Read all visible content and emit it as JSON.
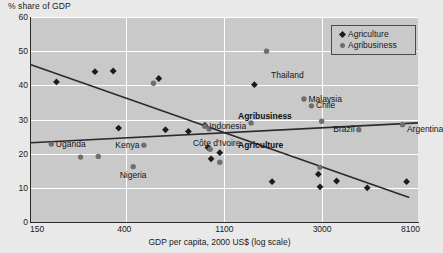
{
  "chart_data": {
    "type": "scatter",
    "title": "",
    "ylabel": "% share of GDP",
    "xlabel": "GDP per capita, 2000 US$ (log scale)",
    "xscale": "log",
    "xlim": [
      150,
      8100
    ],
    "ylim": [
      0,
      60
    ],
    "yticks": [
      0,
      10,
      20,
      30,
      40,
      50,
      60
    ],
    "xticks": [
      150,
      400,
      1100,
      3000,
      8100
    ],
    "xtick_labels": [
      "150",
      "400",
      "1100",
      "3000",
      "8100"
    ],
    "ytick_labels": [
      "0",
      "10",
      "20",
      "30",
      "40",
      "50",
      "60"
    ],
    "grid": true,
    "legend_position": "top-right",
    "legend": [
      {
        "name": "Agriculture",
        "marker": "diamond",
        "color": "#1b1b1b"
      },
      {
        "name": "Agribusiness",
        "marker": "circle",
        "color": "#6e6e6e"
      }
    ],
    "series": [
      {
        "name": "Agriculture",
        "marker": "diamond",
        "color": "#1b1b1b",
        "points": [
          {
            "x": 195,
            "y": 41.0
          },
          {
            "x": 290,
            "y": 44.0
          },
          {
            "x": 350,
            "y": 44.2
          },
          {
            "x": 370,
            "y": 27.5
          },
          {
            "x": 560,
            "y": 42.0
          },
          {
            "x": 600,
            "y": 27.0
          },
          {
            "x": 760,
            "y": 26.5
          },
          {
            "x": 900,
            "y": 28.3
          },
          {
            "x": 930,
            "y": 21.8
          },
          {
            "x": 960,
            "y": 18.5
          },
          {
            "x": 1050,
            "y": 20.3
          },
          {
            "x": 1500,
            "y": 40.2
          },
          {
            "x": 1800,
            "y": 11.8
          },
          {
            "x": 2900,
            "y": 14.0
          },
          {
            "x": 2950,
            "y": 10.3
          },
          {
            "x": 3500,
            "y": 12.0
          },
          {
            "x": 4800,
            "y": 10.0
          },
          {
            "x": 7200,
            "y": 11.8
          }
        ]
      },
      {
        "name": "Agribusiness",
        "marker": "circle",
        "color": "#6e6e6e",
        "points": [
          {
            "x": 185,
            "y": 22.8
          },
          {
            "x": 250,
            "y": 19.0
          },
          {
            "x": 300,
            "y": 19.2
          },
          {
            "x": 430,
            "y": 16.2
          },
          {
            "x": 480,
            "y": 22.5
          },
          {
            "x": 530,
            "y": 40.6
          },
          {
            "x": 900,
            "y": 28.0
          },
          {
            "x": 940,
            "y": 27.2
          },
          {
            "x": 950,
            "y": 21.3
          },
          {
            "x": 1050,
            "y": 17.5
          },
          {
            "x": 1450,
            "y": 29.0
          },
          {
            "x": 1700,
            "y": 50.0
          },
          {
            "x": 2500,
            "y": 36.0
          },
          {
            "x": 2700,
            "y": 34.0
          },
          {
            "x": 2950,
            "y": 16.0
          },
          {
            "x": 3000,
            "y": 29.5
          },
          {
            "x": 4400,
            "y": 27.0
          },
          {
            "x": 6900,
            "y": 28.5
          }
        ]
      }
    ],
    "trendlines": [
      {
        "name": "Agriculture",
        "label": "Agriculture",
        "from": {
          "x": 150,
          "y": 46.0
        },
        "to": {
          "x": 7400,
          "y": 7.2
        },
        "color": "#2a2a2a"
      },
      {
        "name": "Agribusiness",
        "label": "Agribusiness",
        "from": {
          "x": 150,
          "y": 23.2
        },
        "to": {
          "x": 8100,
          "y": 29.0
        },
        "color": "#2a2a2a"
      }
    ],
    "annotations": [
      {
        "text": "Uganda",
        "x": 185,
        "y": 22.8,
        "anchor": "right"
      },
      {
        "text": "Kenya",
        "x": 480,
        "y": 22.5,
        "anchor": "left"
      },
      {
        "text": "Côte d'Ivoire",
        "x": 760,
        "y": 23.0,
        "anchor": "right"
      },
      {
        "text": "Nigeria",
        "x": 430,
        "y": 13.5,
        "anchor": "center"
      },
      {
        "text": "Indonesia",
        "x": 900,
        "y": 28.0,
        "anchor": "right"
      },
      {
        "text": "Thailand",
        "x": 1700,
        "y": 43.0,
        "anchor": "right"
      },
      {
        "text": "Malaysia",
        "x": 2500,
        "y": 36.0,
        "anchor": "right"
      },
      {
        "text": "Chile",
        "x": 2700,
        "y": 34.0,
        "anchor": "right"
      },
      {
        "text": "Brazil",
        "x": 4400,
        "y": 27.0,
        "anchor": "left"
      },
      {
        "text": "Argentina",
        "x": 6900,
        "y": 27.0,
        "anchor": "right"
      }
    ]
  },
  "labels": {
    "y_axis_title": "% share of GDP",
    "x_axis_title": "GDP per capita, 2000 US$ (log scale)",
    "ytick_0": "0",
    "ytick_10": "10",
    "ytick_20": "20",
    "ytick_30": "30",
    "ytick_40": "40",
    "ytick_50": "50",
    "ytick_60": "60",
    "xtick_150": "150",
    "xtick_400": "400",
    "xtick_1100": "1100",
    "xtick_3000": "3000",
    "xtick_8100": "8100",
    "trend_agriculture": "Agriculture",
    "trend_agribusiness": "Agribusiness",
    "legend_agriculture": "Agriculture",
    "legend_agribusiness": "Agribusiness",
    "country_uganda": "Uganda",
    "country_kenya": "Kenya",
    "country_cote_divoire": "Côte d'Ivoire",
    "country_nigeria": "Nigeria",
    "country_indonesia": "Indonesia",
    "country_thailand": "Thailand",
    "country_malaysia": "Malaysia",
    "country_chile": "Chile",
    "country_brazil": "Brazil",
    "country_argentina": "Argentina"
  },
  "colors": {
    "page_background": "#e9e9e9",
    "plot_background": "#c9c9c9",
    "gridline": "#ffffff",
    "axis": "#2b2b2b",
    "agriculture": "#1b1b1b",
    "agribusiness": "#6e6e6e"
  }
}
